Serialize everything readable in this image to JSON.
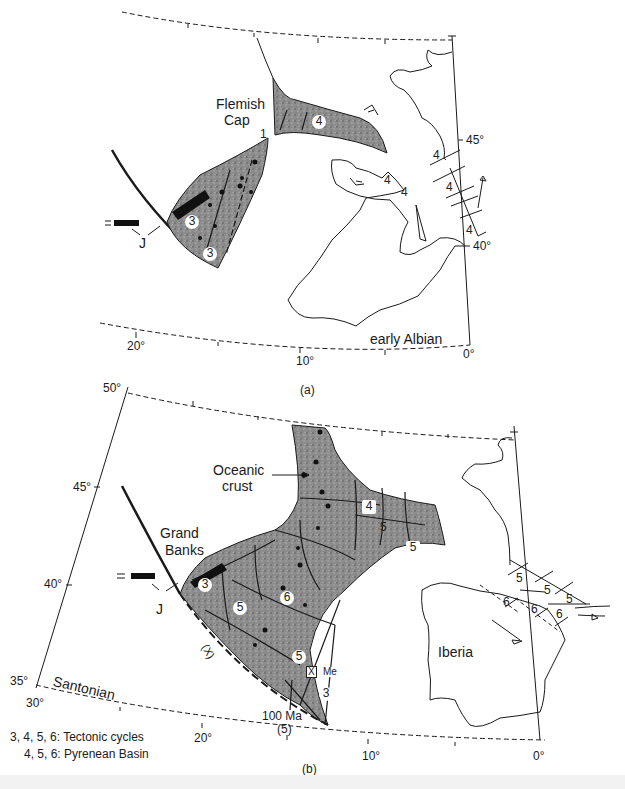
{
  "panel_a": {
    "caption": "(a)",
    "stage_label": "early Albian",
    "place_labels": {
      "flemish_cap_line1": "Flemish",
      "flemish_cap_line2": "Cap"
    },
    "fault_arrow_label": "1",
    "lat_ticks": [
      "45°",
      "40°"
    ],
    "lon_ticks": [
      "20°",
      "10°",
      "0°"
    ],
    "j_label": "J",
    "cycle_numbers": {
      "flemish_basin": "4",
      "grand_banks_upper": "3",
      "grand_banks_lower": "3",
      "iberia_a": "4",
      "iberia_b": "4",
      "pyrenees_1": "4",
      "pyrenees_2": "4",
      "pyrenees_3": "4"
    }
  },
  "panel_b": {
    "caption": "(b)",
    "stage_label": "Santonian",
    "place_labels": {
      "oceanic_crust_line1": "Oceanic",
      "oceanic_crust_line2": "crust",
      "grand_banks_line1": "Grand",
      "grand_banks_line2": "Banks",
      "iberia": "Iberia"
    },
    "lat_ticks": [
      "50°",
      "45°",
      "40°",
      "35°"
    ],
    "lon_ticks": [
      "30°",
      "20°",
      "10°",
      "0°"
    ],
    "j_label": "J",
    "x_label_circle": "(X)",
    "x_label_box": "X",
    "me_label": "Me",
    "age_label": "100 Ma",
    "age_cycle": "(5)",
    "cycle_numbers": {
      "gb_3": "3",
      "gb_5a": "5",
      "gb_6": "6",
      "gb_5b": "5",
      "gb_3b": "3",
      "bay_4": "4",
      "bay_5a": "5",
      "bay_5b": "5",
      "pyr_5a": "5",
      "pyr_5b": "5",
      "pyr_5c": "5",
      "pyr_6a": "6",
      "pyr_6b": "6",
      "pyr_6c": "6"
    }
  },
  "legend": {
    "line1": "3, 4, 5, 6: Tectonic cycles",
    "line2": "4, 5, 6: Pyrenean Basin"
  },
  "colors": {
    "ink": "#1a1a1a",
    "stipple_fill": "#8a8a8a",
    "background": "#ffffff",
    "footer": "#f2f2f2"
  }
}
